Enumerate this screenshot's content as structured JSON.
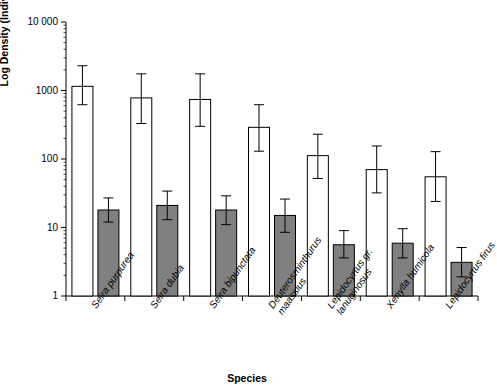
{
  "chart_data": {
    "type": "bar",
    "title": "",
    "subtitle": "",
    "xlabel": "Species",
    "ylabel": "Log Density (Individuals m⁻²) ± SD",
    "ylim": [
      1,
      10000
    ],
    "yscale": "log",
    "grid": false,
    "legend": null,
    "ytick_labels": [
      "10 000",
      "1000",
      "100",
      "10",
      "1"
    ],
    "ytick_values": [
      10000,
      1000,
      100,
      10,
      1
    ],
    "categories": [
      "Seira purpurea",
      "Seira dubia",
      "Seira bipunctata",
      "Deuterosminthurus maassius",
      "Lepidocyrtus gr. lanuginosus",
      "Xenylla humicola",
      "Lepidocyrtus firus"
    ],
    "category_lines": [
      [
        "Seira purpurea"
      ],
      [
        "Seira dubia"
      ],
      [
        "Seira bipunctata"
      ],
      [
        "Deuterosminthurus",
        "maassius"
      ],
      [
        "Lepidocyrtus gr.",
        "lanuginosus"
      ],
      [
        "Xenylla humicola"
      ],
      [
        "Lepidocyrtus firus"
      ]
    ],
    "series": [
      {
        "name": "white",
        "color": "#ffffff",
        "values": [
          1150,
          780,
          740,
          290,
          112,
          70,
          55
        ],
        "err_low": [
          620,
          330,
          300,
          130,
          52,
          32,
          24
        ],
        "err_high": [
          2300,
          1750,
          1750,
          620,
          230,
          155,
          128
        ]
      },
      {
        "name": "grey",
        "color": "#808080",
        "values": [
          18,
          21,
          18,
          15,
          5.6,
          5.9,
          3.1
        ],
        "err_low": [
          12,
          13,
          11,
          8.5,
          3.6,
          3.6,
          1.9
        ],
        "err_high": [
          27,
          34,
          29,
          26,
          9.0,
          9.6,
          5.1
        ]
      }
    ]
  }
}
